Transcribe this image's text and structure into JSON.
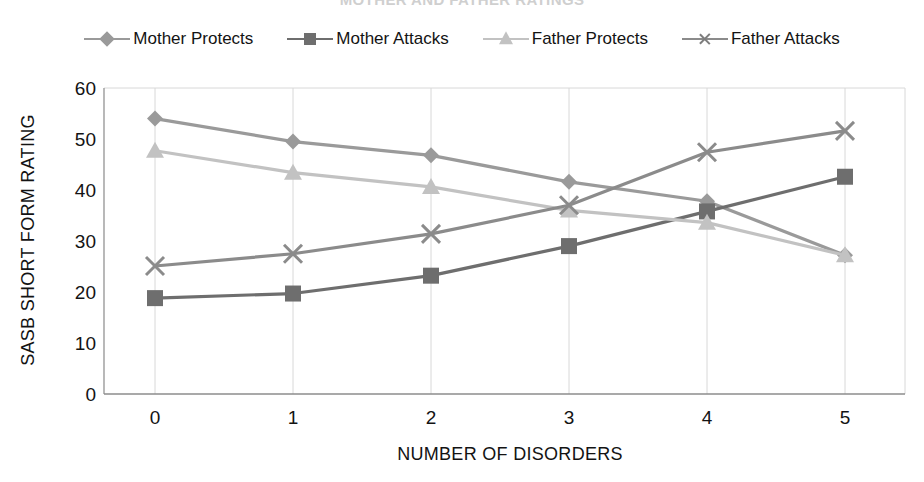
{
  "figure": {
    "title_partial": "MOTHER AND FATHER RATINGS",
    "title_clipped": true
  },
  "legend": {
    "position": "top",
    "items": [
      {
        "label": "Mother Protects",
        "marker": "diamond",
        "color": "#9a9a9a"
      },
      {
        "label": "Mother Attacks",
        "marker": "square",
        "color": "#6e6e6e"
      },
      {
        "label": "Father Protects",
        "marker": "triangle",
        "color": "#c2c2c2"
      },
      {
        "label": "Father Attacks",
        "marker": "x",
        "color": "#8b8b8b"
      }
    ]
  },
  "chart_data": {
    "type": "line",
    "title": "MOTHER AND FATHER RATINGS",
    "xlabel": "NUMBER OF DISORDERS",
    "ylabel": "SASB SHORT FORM RATING",
    "x": [
      0,
      1,
      2,
      3,
      4,
      5
    ],
    "categories": [
      "0",
      "1",
      "2",
      "3",
      "4",
      "5"
    ],
    "ylim": [
      0,
      60
    ],
    "ytick_labels": [
      "0",
      "10",
      "20",
      "30",
      "40",
      "50",
      "60"
    ],
    "yticks": [
      0,
      10,
      20,
      30,
      40,
      50,
      60
    ],
    "grid": "vertical",
    "legend_position": "top",
    "series": [
      {
        "name": "Mother Protects",
        "marker": "diamond",
        "color": "#9a9a9a",
        "values": [
          54.0,
          49.5,
          46.8,
          41.6,
          37.8,
          27.2
        ]
      },
      {
        "name": "Mother Attacks",
        "marker": "square",
        "color": "#6e6e6e",
        "values": [
          18.8,
          19.7,
          23.2,
          29.0,
          35.8,
          42.6
        ]
      },
      {
        "name": "Father Protects",
        "marker": "triangle",
        "color": "#c2c2c2",
        "values": [
          47.7,
          43.4,
          40.6,
          36.0,
          33.6,
          27.2
        ]
      },
      {
        "name": "Father Attacks",
        "marker": "x",
        "color": "#8b8b8b",
        "values": [
          25.1,
          27.5,
          31.4,
          37.0,
          47.4,
          51.6
        ]
      }
    ]
  },
  "axes": {
    "y_title": "SASB SHORT FORM RATING",
    "x_title": "NUMBER OF DISORDERS",
    "y_ticks": [
      "60",
      "50",
      "40",
      "30",
      "20",
      "10",
      "0"
    ],
    "x_ticks": [
      "0",
      "1",
      "2",
      "3",
      "4",
      "5"
    ]
  }
}
